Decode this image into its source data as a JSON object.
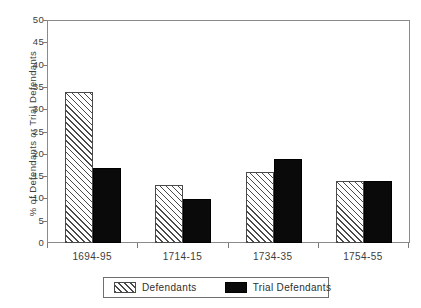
{
  "chart_data": {
    "type": "bar",
    "title": "",
    "xlabel": "",
    "ylabel": "% of Defendants or Trial Defendants",
    "ylim": [
      0,
      50
    ],
    "ytick_step": 5,
    "yticks": [
      50,
      45,
      40,
      35,
      30,
      25,
      20,
      15,
      10,
      5,
      0
    ],
    "grid": false,
    "legend_position": "bottom",
    "categories": [
      "1694-95",
      "1714-15",
      "1734-35",
      "1754-55"
    ],
    "series": [
      {
        "name": "Defendants",
        "fill": "hatched",
        "color": "#4a4a4a",
        "values": [
          34,
          13,
          16,
          14
        ]
      },
      {
        "name": "Trial Defendants",
        "fill": "solid",
        "color": "#0a0a0a",
        "values": [
          17,
          10,
          19,
          14
        ]
      }
    ]
  },
  "axes": {
    "y_title": "% of Defendants or Trial Defendants",
    "y_tick_labels": [
      "50",
      "45",
      "40",
      "35",
      "30",
      "25",
      "20",
      "15",
      "10",
      "5",
      "0"
    ],
    "x_tick_labels": [
      "1694-95",
      "1714-15",
      "1734-35",
      "1754-55"
    ]
  },
  "legend": {
    "items": [
      {
        "label": "Defendants",
        "swatch": "hatched-swatch"
      },
      {
        "label": "Trial Defendants",
        "swatch": "solid-black-swatch"
      }
    ]
  }
}
